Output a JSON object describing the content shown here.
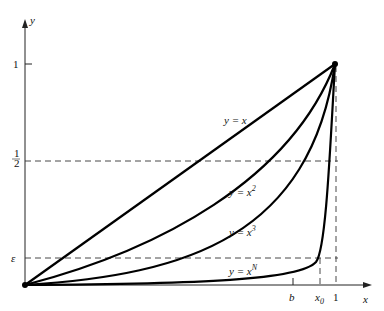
{
  "figure": {
    "axes": {
      "x_label": "x",
      "y_label": "y"
    },
    "y_ticks": [
      {
        "label": "1"
      },
      {
        "label_num": "1",
        "label_den": "2"
      },
      {
        "label": "ε"
      }
    ],
    "x_ticks": [
      {
        "label": "b"
      },
      {
        "label": "x",
        "sub": "0"
      },
      {
        "label": "1"
      }
    ],
    "curves": [
      {
        "label_pre": "y = x",
        "sup": ""
      },
      {
        "label_pre": "y = x",
        "sup": "2"
      },
      {
        "label_pre": "y = x",
        "sup": "3"
      },
      {
        "label_pre": "y = x",
        "sup": "N"
      }
    ]
  }
}
